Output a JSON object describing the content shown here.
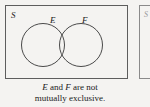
{
  "diagram": {
    "type": "venn-diagram",
    "sample_space_label": "S",
    "sets": [
      {
        "id": "E",
        "label": "E"
      },
      {
        "id": "F",
        "label": "F"
      }
    ],
    "relationship": "overlapping",
    "secondary_box": {
      "sample_space_label": "S",
      "cropped": true
    }
  },
  "caption": {
    "line1_var1": "E",
    "line1_mid": " and ",
    "line1_var2": "F",
    "line1_end": " are not",
    "line2": "mutually exclusive.",
    "full_text": "E and F are not mutually exclusive."
  },
  "colors": {
    "background": "#f4f3f1",
    "box_border": "#5d5d5d",
    "circle_stroke": "#4a4a4a",
    "text": "#1a1a1a"
  }
}
